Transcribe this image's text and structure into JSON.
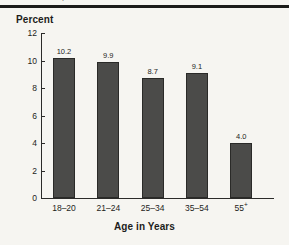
{
  "figure": {
    "background_color": "#f6f5f1",
    "top_rule_color": "#1b1b19",
    "clipped_header_fragment": "."
  },
  "chart_data": {
    "type": "bar",
    "title": "",
    "subtitle": "",
    "categories": [
      "18–20",
      "21–24",
      "25–34",
      "35–54",
      "55+"
    ],
    "values": [
      10.2,
      9.9,
      8.7,
      9.1,
      4.0
    ],
    "value_labels": [
      "10.2",
      "9.9",
      "8.7",
      "9.1",
      "4.0"
    ],
    "xlabel": "Age in Years",
    "ylabel": "Percent",
    "ylim": [
      0,
      12
    ],
    "yticks": [
      0,
      2,
      4,
      6,
      8,
      10,
      12
    ],
    "ytick_labels": [
      "0",
      "2",
      "4",
      "6",
      "8",
      "10",
      "12"
    ],
    "grid": false,
    "legend": null,
    "bar_color": "#4b4b49",
    "bar_edge_color": "#2a2a28",
    "axis_color": "#2b2b29"
  }
}
